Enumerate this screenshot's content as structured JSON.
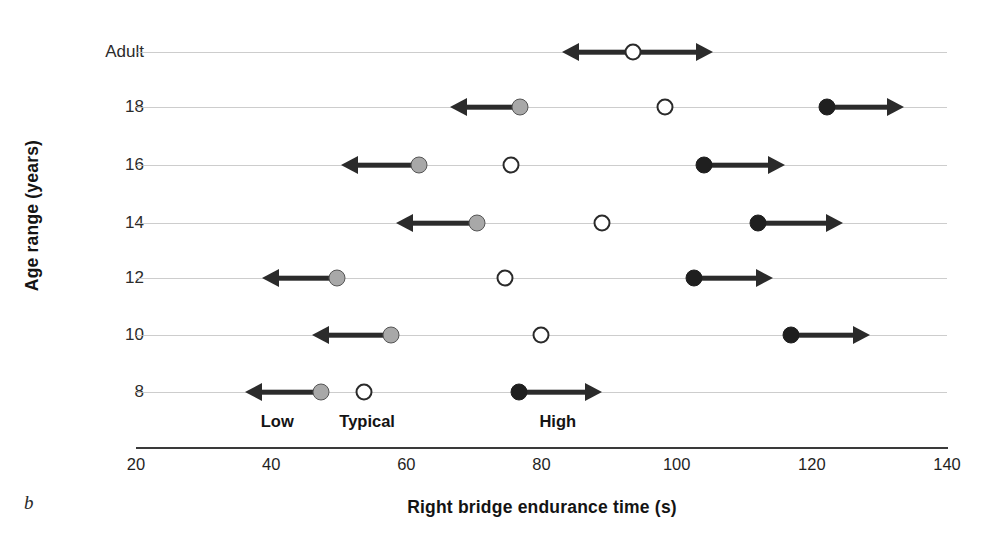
{
  "panel": {
    "label": "b"
  },
  "axes": {
    "x_title": "Right bridge endurance time (s)",
    "y_title": "Age range (years)",
    "x_ticks": [
      20,
      40,
      60,
      80,
      100,
      120,
      140
    ],
    "y_ticks": [
      "Adult",
      "18",
      "16",
      "14",
      "12",
      "10",
      "8"
    ]
  },
  "legend_labels": [
    {
      "text": "Low",
      "x_value": 40.9
    },
    {
      "text": "Typical",
      "x_value": 54.2
    },
    {
      "text": "High",
      "x_value": 82.4
    }
  ],
  "colors": {
    "low": "#a8a8a8",
    "typical": "#ffffff",
    "high": "#1f1f1f",
    "arrow": "#2b2b2b",
    "gridline": "#c4c4c4",
    "axis": "#3a3a3a",
    "text": "#141414"
  },
  "chart_data": {
    "type": "scatter",
    "title": "",
    "subtitle": "",
    "xlabel": "Right bridge endurance time (s)",
    "ylabel": "Age range (years)",
    "xlim": [
      20,
      140
    ],
    "xticks": [
      20,
      40,
      60,
      80,
      100,
      120,
      140
    ],
    "categories": [
      "Adult",
      "18",
      "16",
      "14",
      "12",
      "10",
      "8"
    ],
    "grid": true,
    "legend": "inline-annotations",
    "annotations": [
      "Low",
      "Typical",
      "High"
    ],
    "series": [
      {
        "name": "Low",
        "marker": "gray-filled-circle",
        "arrow": "left",
        "values": [
          null,
          76.8,
          61.9,
          70.4,
          49.7,
          57.7,
          47.4
        ]
      },
      {
        "name": "Typical",
        "marker": "open-circle",
        "arrow": "none",
        "values": [
          93.6,
          98.3,
          75.5,
          88.9,
          74.6,
          79.9,
          53.7
        ]
      },
      {
        "name": "High",
        "marker": "black-filled-circle",
        "arrow": "right",
        "values": [
          null,
          122.2,
          104.1,
          112.1,
          102.5,
          116.9,
          76.7
        ]
      }
    ],
    "rows": [
      {
        "category": "Adult",
        "points": [
          {
            "series": "Typical",
            "value": 93.6,
            "arrow": "both",
            "arrow_left_end": 83.1,
            "arrow_right_end": 105.4
          }
        ]
      },
      {
        "category": "18",
        "points": [
          {
            "series": "Low",
            "value": 76.8,
            "arrow": "left",
            "arrow_end": 66.5
          },
          {
            "series": "Typical",
            "value": 98.3,
            "arrow": "none"
          },
          {
            "series": "High",
            "value": 122.2,
            "arrow": "right",
            "arrow_end": 133.7
          }
        ]
      },
      {
        "category": "16",
        "points": [
          {
            "series": "Low",
            "value": 61.9,
            "arrow": "left",
            "arrow_end": 50.4
          },
          {
            "series": "Typical",
            "value": 75.5,
            "arrow": "none"
          },
          {
            "series": "High",
            "value": 104.1,
            "arrow": "right",
            "arrow_end": 116.0
          }
        ]
      },
      {
        "category": "14",
        "points": [
          {
            "series": "Low",
            "value": 70.4,
            "arrow": "left",
            "arrow_end": 58.4
          },
          {
            "series": "Typical",
            "value": 88.9,
            "arrow": "none"
          },
          {
            "series": "High",
            "value": 112.1,
            "arrow": "right",
            "arrow_end": 124.6
          }
        ]
      },
      {
        "category": "12",
        "points": [
          {
            "series": "Low",
            "value": 49.7,
            "arrow": "left",
            "arrow_end": 38.6
          },
          {
            "series": "Typical",
            "value": 74.6,
            "arrow": "none"
          },
          {
            "series": "High",
            "value": 102.5,
            "arrow": "right",
            "arrow_end": 114.2
          }
        ]
      },
      {
        "category": "10",
        "points": [
          {
            "series": "Low",
            "value": 57.7,
            "arrow": "left",
            "arrow_end": 46.1
          },
          {
            "series": "Typical",
            "value": 79.9,
            "arrow": "none"
          },
          {
            "series": "High",
            "value": 116.9,
            "arrow": "right",
            "arrow_end": 128.6
          }
        ]
      },
      {
        "category": "8",
        "points": [
          {
            "series": "Low",
            "value": 47.4,
            "arrow": "left",
            "arrow_end": 36.1
          },
          {
            "series": "Typical",
            "value": 53.7,
            "arrow": "none"
          },
          {
            "series": "High",
            "value": 76.7,
            "arrow": "right",
            "arrow_end": 89.0
          }
        ]
      }
    ]
  }
}
